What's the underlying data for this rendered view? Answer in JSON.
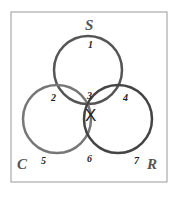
{
  "diagram": {
    "type": "venn",
    "sets": [
      {
        "name": "S",
        "label": "S"
      },
      {
        "name": "C",
        "label": "C"
      },
      {
        "name": "R",
        "label": "R"
      }
    ],
    "regions": [
      "1",
      "2",
      "3",
      "4",
      "5",
      "6",
      "7"
    ],
    "mark": {
      "region": "3",
      "symbol": "X"
    }
  },
  "colors": {
    "border": "#888888",
    "circle_s": "#555555",
    "circle_c": "#777777",
    "circle_r": "#444444"
  }
}
